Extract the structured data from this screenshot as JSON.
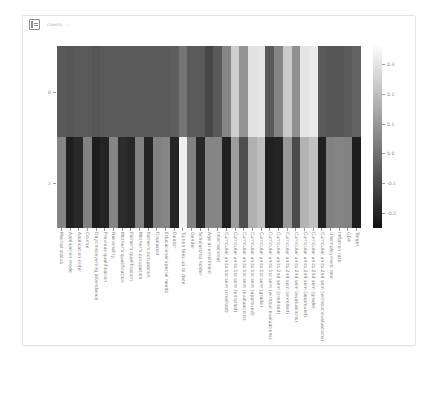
{
  "toolbar": {
    "icon": "notebook-cell-icon",
    "text": "clients",
    "caret": "›"
  },
  "chart_data": {
    "type": "heatmap",
    "title": "",
    "xlabel": "",
    "ylabel": "",
    "colormap": "gray",
    "grid": false,
    "legend_position": "right",
    "y_categories": [
      "0",
      "1"
    ],
    "categories": [
      "Marital status",
      "Application mode",
      "Application order",
      "Course",
      "Daytime/evening attendance",
      "Previous qualification",
      "Nacionality",
      "Mother's qualification",
      "Father's qualification",
      "Mother's occupation",
      "Father's occupation",
      "Displaced",
      "Educational special needs",
      "Debtor",
      "Tuition fees up to date",
      "Gender",
      "Scholarship holder",
      "Age at enrollment",
      "International",
      "Curricular units 1st sem (credited)",
      "Curricular units 1st sem (enrolled)",
      "Curricular units 1st sem (evaluations)",
      "Curricular units 1st sem (approved)",
      "Curricular units 1st sem (grade)",
      "Curricular units 1st sem (without evaluations)",
      "Curricular units 2nd sem (credited)",
      "Curricular units 2nd sem (enrolled)",
      "Curricular units 2nd sem (evaluations)",
      "Curricular units 2nd sem (approved)",
      "Curricular units 2nd sem (grade)",
      "Curricular units 2nd sem (without evaluations)",
      "Unemployment rate",
      "Inflation rate",
      "GDP",
      "Target"
    ],
    "series": [
      {
        "name": "0",
        "values": [
          -0.06,
          -0.07,
          -0.06,
          -0.06,
          -0.07,
          -0.06,
          -0.06,
          -0.06,
          -0.06,
          -0.06,
          -0.06,
          -0.06,
          -0.06,
          -0.05,
          0.01,
          -0.06,
          -0.06,
          -0.11,
          -0.06,
          0.05,
          0.24,
          0.09,
          0.29,
          0.3,
          -0.06,
          0.05,
          0.23,
          0.08,
          0.3,
          0.31,
          -0.06,
          -0.07,
          -0.07,
          -0.06,
          -0.04
        ]
      },
      {
        "name": "1",
        "values": [
          0.05,
          -0.21,
          -0.19,
          0.04,
          -0.22,
          -0.2,
          0.05,
          -0.18,
          -0.19,
          0.04,
          -0.2,
          0.04,
          0.05,
          -0.2,
          0.33,
          0.04,
          -0.19,
          0.05,
          0.05,
          -0.21,
          0.11,
          -0.09,
          0.16,
          0.2,
          -0.21,
          -0.2,
          0.1,
          -0.1,
          0.17,
          0.21,
          -0.21,
          0.04,
          0.05,
          0.04,
          -0.22
        ]
      }
    ],
    "colorbar": {
      "vmin": -0.25,
      "vmax": 0.36,
      "ticks": [
        0.3,
        0.2,
        0.1,
        0.0,
        -0.1,
        -0.2
      ],
      "tick_labels": [
        "0.3",
        "0.2",
        "0.1",
        "0.0",
        "-0.1",
        "-0.2"
      ]
    }
  }
}
